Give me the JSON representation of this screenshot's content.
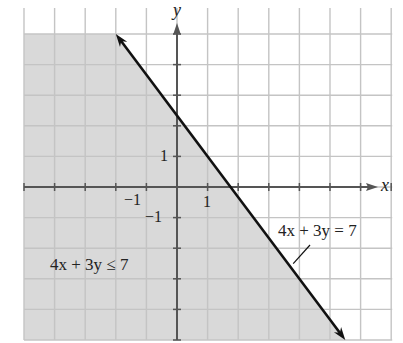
{
  "chart_data": {
    "type": "line",
    "title": "",
    "xlabel": "x",
    "ylabel": "y",
    "xlim": [
      -5,
      7
    ],
    "ylim": [
      -5,
      5
    ],
    "grid": true,
    "grid_step": 1,
    "tick_labels": {
      "x": [
        {
          "value": -1,
          "label": "−1"
        },
        {
          "value": 1,
          "label": "1"
        }
      ],
      "y": [
        {
          "value": -1,
          "label": "−1"
        },
        {
          "value": 1,
          "label": "1"
        }
      ]
    },
    "series": [
      {
        "name": "boundary",
        "equation": "4x + 3y = 7",
        "style": "solid",
        "arrows": "both",
        "points": [
          [
            -2,
            5
          ],
          [
            5.5,
            -5
          ]
        ]
      }
    ],
    "shaded_region": {
      "inequality": "4x + 3y ≤ 7",
      "side": "below-left",
      "color": "#d9d9d9"
    },
    "annotations": [
      {
        "text": "4x + 3y = 7",
        "at": [
          3.3,
          -1.6
        ],
        "pointer_to": [
          3.7,
          -2.6
        ]
      },
      {
        "text": "4x + 3y ≤ 7",
        "at": [
          -4.2,
          -2.7
        ]
      }
    ]
  },
  "labels": {
    "x_axis": "x",
    "y_axis": "y",
    "tick_x_neg1": "−1",
    "tick_x_1": "1",
    "tick_y_1": "1",
    "tick_y_neg1": "−1",
    "equation_label": "4x + 3y = 7",
    "inequality_label": "4x + 3y ≤ 7"
  },
  "colors": {
    "shade": "#d9d9d9",
    "grid": "#c4c4c4",
    "axis": "#555555",
    "line": "#111111"
  }
}
